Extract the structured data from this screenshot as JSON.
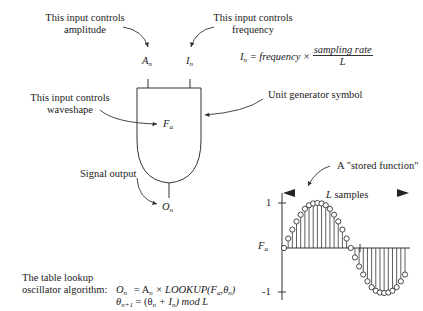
{
  "annotations": {
    "amplitude_label_line1": "This input controls",
    "amplitude_label_line2": "amplitude",
    "frequency_label_line1": "This input controls",
    "frequency_label_line2": "frequency",
    "waveshape_label_line1": "This input controls",
    "waveshape_label_line2": "waveshape",
    "unit_generator_label": "Unit generator symbol",
    "signal_output_label": "Signal output",
    "stored_function_label": "A \"stored function\"",
    "samples_label_var": "L",
    "samples_label_text": " samples"
  },
  "unit_generator": {
    "input_amplitude": "A",
    "input_amplitude_sub": "n",
    "input_frequency": "I",
    "input_frequency_sub": "n",
    "waveshape": "F",
    "waveshape_sub": "a",
    "output": "O",
    "output_sub": "n"
  },
  "frequency_formula": {
    "lhs": "I",
    "lhs_sub": "n",
    "rhs_prefix": " = frequency × ",
    "numerator": "sampling rate",
    "denominator": "L"
  },
  "algorithm": {
    "label_line1": "The table lookup",
    "label_line2": "oscillator algorithm:",
    "eq1_lhs": "O",
    "eq1_lhs_sub": "n",
    "eq1_rhs": "= A",
    "eq1_rhs_sub": "n",
    "eq1_rest": " × LOOKUP(F",
    "eq1_rest_sub": "a",
    "eq1_rest2": ",θ",
    "eq1_rest2_sub": "n",
    "eq1_close": ")",
    "eq2_lhs": "θ",
    "eq2_lhs_sub": "n+1",
    "eq2_rhs": "= (θ",
    "eq2_rhs_sub": "n",
    "eq2_mid": " + I",
    "eq2_mid_sub": "n",
    "eq2_end": ") mod L"
  },
  "waveform_plot": {
    "y_tick_top": "1",
    "y_tick_bottom": "-1",
    "y_axis_label": "F",
    "y_axis_label_sub": "a"
  },
  "chart_data": {
    "type": "scatter",
    "title": "A \"stored function\"",
    "xlabel": "L samples",
    "ylabel": "Fa",
    "ylim": [
      -1,
      1
    ],
    "y_ticks": [
      "1",
      "-1"
    ],
    "sample_count": 30,
    "values": [
      0.0,
      0.21,
      0.41,
      0.59,
      0.74,
      0.87,
      0.95,
      0.99,
      1.0,
      0.99,
      0.95,
      0.87,
      0.74,
      0.59,
      0.41,
      0.21,
      0.0,
      -0.21,
      -0.41,
      -0.59,
      -0.74,
      -0.87,
      -0.95,
      -0.99,
      -1.0,
      -0.99,
      -0.95,
      -0.87,
      -0.74,
      -0.59
    ]
  }
}
